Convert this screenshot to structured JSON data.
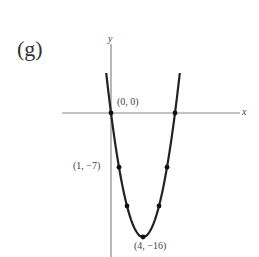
{
  "panel_label": "(g)",
  "axes": {
    "x_label": "x",
    "y_label": "y"
  },
  "labels": {
    "origin": "(0, 0)",
    "point_1": "(1, −7)",
    "vertex": "(4, −16)"
  },
  "chart_data": {
    "type": "line",
    "title": "(g)",
    "xlabel": "x",
    "ylabel": "y",
    "function": "y = x^2 - 8x",
    "series": [
      {
        "name": "parabola",
        "x": [
          -0.6,
          0,
          1,
          2,
          4,
          6,
          7,
          8,
          8.6
        ],
        "y": [
          5.16,
          0,
          -7,
          -12,
          -16,
          -12,
          -7,
          0,
          5.16
        ]
      }
    ],
    "marked_points": [
      {
        "x": 0,
        "y": 0,
        "label": "(0, 0)"
      },
      {
        "x": 1,
        "y": -7,
        "label": "(1, −7)"
      },
      {
        "x": 2,
        "y": -12,
        "label": ""
      },
      {
        "x": 4,
        "y": -16,
        "label": "(4, −16)"
      },
      {
        "x": 6,
        "y": -12,
        "label": ""
      },
      {
        "x": 7,
        "y": -7,
        "label": ""
      },
      {
        "x": 8,
        "y": 0,
        "label": ""
      }
    ],
    "grid": false,
    "legend": null
  }
}
